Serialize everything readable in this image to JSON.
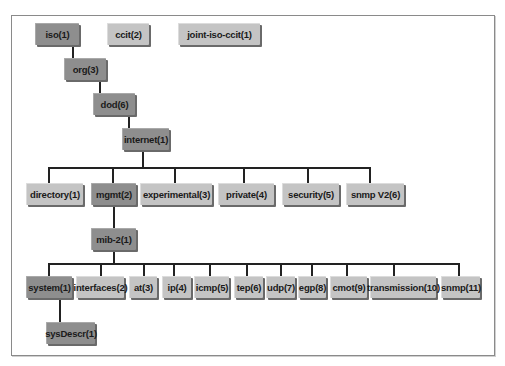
{
  "caption_fragment": "",
  "diagram": {
    "top_row": [
      {
        "id": "iso",
        "label": "iso(1)",
        "shade": "dark"
      },
      {
        "id": "ccit",
        "label": "ccit(2)",
        "shade": "light"
      },
      {
        "id": "joint-iso-ccit",
        "label": "joint-iso-ccit(1)",
        "shade": "light"
      }
    ],
    "chain": [
      {
        "id": "org",
        "label": "org(3)",
        "shade": "dark"
      },
      {
        "id": "dod",
        "label": "dod(6)",
        "shade": "dark"
      },
      {
        "id": "internet",
        "label": "internet(1)",
        "shade": "dark"
      }
    ],
    "internet_children": [
      {
        "id": "directory",
        "label": "directory(1)",
        "shade": "light"
      },
      {
        "id": "mgmt",
        "label": "mgmt(2)",
        "shade": "dark"
      },
      {
        "id": "experimental",
        "label": "experimental(3)",
        "shade": "light"
      },
      {
        "id": "private",
        "label": "private(4)",
        "shade": "light"
      },
      {
        "id": "security",
        "label": "security(5)",
        "shade": "light"
      },
      {
        "id": "snmpv2",
        "label": "snmp V2(6)",
        "shade": "light"
      }
    ],
    "mgmt_child": {
      "id": "mib-2",
      "label": "mib-2(1)",
      "shade": "dark"
    },
    "mib2_children": [
      {
        "id": "system",
        "label": "system(1)",
        "shade": "dark"
      },
      {
        "id": "interfaces",
        "label": "interfaces(2)",
        "shade": "light"
      },
      {
        "id": "at",
        "label": "at(3)",
        "shade": "light"
      },
      {
        "id": "ip",
        "label": "ip(4)",
        "shade": "light"
      },
      {
        "id": "icmp",
        "label": "icmp(5)",
        "shade": "light"
      },
      {
        "id": "tcp",
        "label": "tep(6)",
        "shade": "light"
      },
      {
        "id": "udp",
        "label": "udp(7)",
        "shade": "light"
      },
      {
        "id": "egp",
        "label": "egp(8)",
        "shade": "light"
      },
      {
        "id": "cmot",
        "label": "cmot(9)",
        "shade": "light"
      },
      {
        "id": "transmission",
        "label": "transmission(10)",
        "shade": "light"
      },
      {
        "id": "snmp",
        "label": "snmp(11)",
        "shade": "light"
      }
    ],
    "system_child": {
      "id": "sysDescr",
      "label": "sysDescr(1)",
      "shade": "dark"
    },
    "colors": {
      "highlight_path_node": "#8e8e8e",
      "other_node": "#c4c4c4",
      "connector": "#222222",
      "frame_border": "#8a8a8a"
    }
  }
}
